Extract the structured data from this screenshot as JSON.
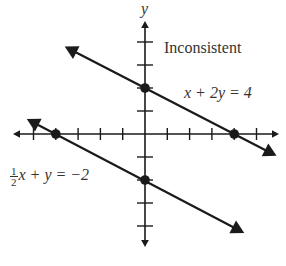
{
  "chart_data": {
    "type": "line",
    "title": "Inconsistent",
    "xlabel": "x",
    "ylabel": "y",
    "xlim": [
      -6,
      6
    ],
    "ylim": [
      -5,
      5
    ],
    "grid": false,
    "tick_spacing": 1,
    "series": [
      {
        "name": "x + 2y = 4",
        "equation": "x + 2y = 4",
        "slope": -0.5,
        "intercept": 2,
        "x": [
          -3.6,
          5.9
        ],
        "y": [
          3.8,
          -0.95
        ],
        "marked_points": [
          [
            0,
            2
          ],
          [
            4,
            0
          ]
        ]
      },
      {
        "name": "1/2x + y = -2",
        "equation": "½x + y = −2",
        "slope": -0.5,
        "intercept": -2,
        "x": [
          -5.3,
          4.45
        ],
        "y": [
          0.65,
          -4.3
        ],
        "marked_points": [
          [
            -4,
            0
          ],
          [
            0,
            -2
          ]
        ]
      }
    ],
    "annotations": [
      "Inconsistent",
      "x + 2y = 4",
      "½x + y = −2"
    ]
  },
  "labels": {
    "y_axis": "y",
    "title": "Inconsistent",
    "eq1_lhs": "x + 2y = 4",
    "eq2_frac_num": "1",
    "eq2_frac_den": "2",
    "eq2_rest": "x + y = −2"
  },
  "colors": {
    "line": "#1a1a1a",
    "text": "#333333",
    "background": "#ffffff"
  }
}
